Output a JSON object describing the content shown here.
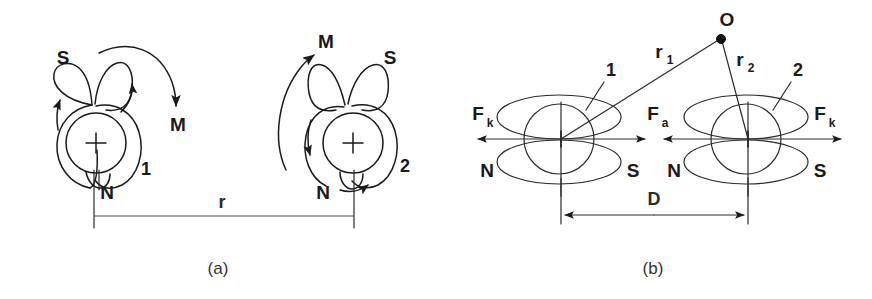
{
  "figure": {
    "type": "diagram",
    "width": 872,
    "height": 299,
    "background_color": "#ffffff",
    "ink_color": "#1a1a1a"
  },
  "panels": [
    {
      "id": "a",
      "caption": "(a)",
      "dipoles": [
        {
          "id": "left",
          "center_symbol": "+",
          "pole_top": "S",
          "pole_bottom": "N",
          "index_label": "1",
          "moment_label": "M",
          "moment_arrow_direction": "clockwise-down-right"
        },
        {
          "id": "right",
          "center_symbol": "+",
          "pole_top": "S",
          "pole_bottom": "N",
          "index_label": "2",
          "moment_label": "M",
          "moment_arrow_direction": "counterclockwise-up-left"
        }
      ],
      "dimension": {
        "label": "r",
        "description": "separation between dipole 1 and dipole 2"
      }
    },
    {
      "id": "b",
      "caption": "(b)",
      "dipoles": [
        {
          "id": "left",
          "index_label": "1",
          "pole_left": "N",
          "pole_right": "S",
          "force_outer_label": "F",
          "force_outer_sub": "k",
          "force_inner_label": "F",
          "force_inner_sub": "a"
        },
        {
          "id": "right",
          "index_label": "2",
          "pole_left": "N",
          "pole_right": "S",
          "force_outer_label": "F",
          "force_outer_sub": "k"
        }
      ],
      "observation_point": {
        "label": "O",
        "distance_1_label": "r",
        "distance_1_sub": "1",
        "distance_2_label": "r",
        "distance_2_sub": "2"
      },
      "dimension": {
        "label": "D",
        "description": "separation between dipole 1 and dipole 2"
      }
    }
  ]
}
